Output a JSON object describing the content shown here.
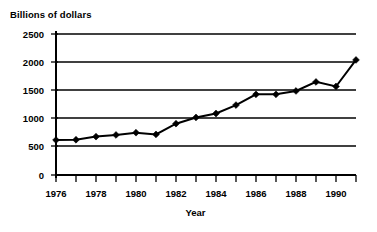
{
  "chart_data": {
    "type": "line",
    "title": "Billions of dollars",
    "xlabel": "Year",
    "ylabel": "",
    "x": [
      1976,
      1977,
      1978,
      1979,
      1980,
      1981,
      1982,
      1983,
      1984,
      1985,
      1986,
      1987,
      1988,
      1989,
      1990,
      1991
    ],
    "values": [
      620,
      625,
      680,
      710,
      750,
      720,
      910,
      1020,
      1090,
      1240,
      1430,
      1430,
      1490,
      1650,
      1570,
      2040
    ],
    "series": [
      {
        "name": "Billions of dollars",
        "values": [
          620,
          625,
          680,
          710,
          750,
          720,
          910,
          1020,
          1090,
          1240,
          1430,
          1430,
          1490,
          1650,
          1570,
          2040
        ]
      }
    ],
    "xlim": [
      1976,
      1991
    ],
    "ylim": [
      0,
      2500
    ],
    "ytick_labels": [
      "2500",
      "2000",
      "1500",
      "1000",
      "500",
      "0"
    ],
    "ytick_values": [
      2500,
      2000,
      1500,
      1000,
      500,
      0
    ],
    "xtick_labels": [
      "1976",
      "1978",
      "1980",
      "1982",
      "1984",
      "1986",
      "1988",
      "1990"
    ],
    "xtick_values": [
      1976,
      1978,
      1980,
      1982,
      1984,
      1986,
      1988,
      1990
    ],
    "grid": "horizontal",
    "legend": "none",
    "marker": "diamond",
    "line_color": "#000000",
    "marker_color": "#000000",
    "grid_color": "#000000",
    "background_color": "#ffffff"
  },
  "axis": {
    "y_title": "Billions of dollars",
    "x_title": "Year"
  }
}
